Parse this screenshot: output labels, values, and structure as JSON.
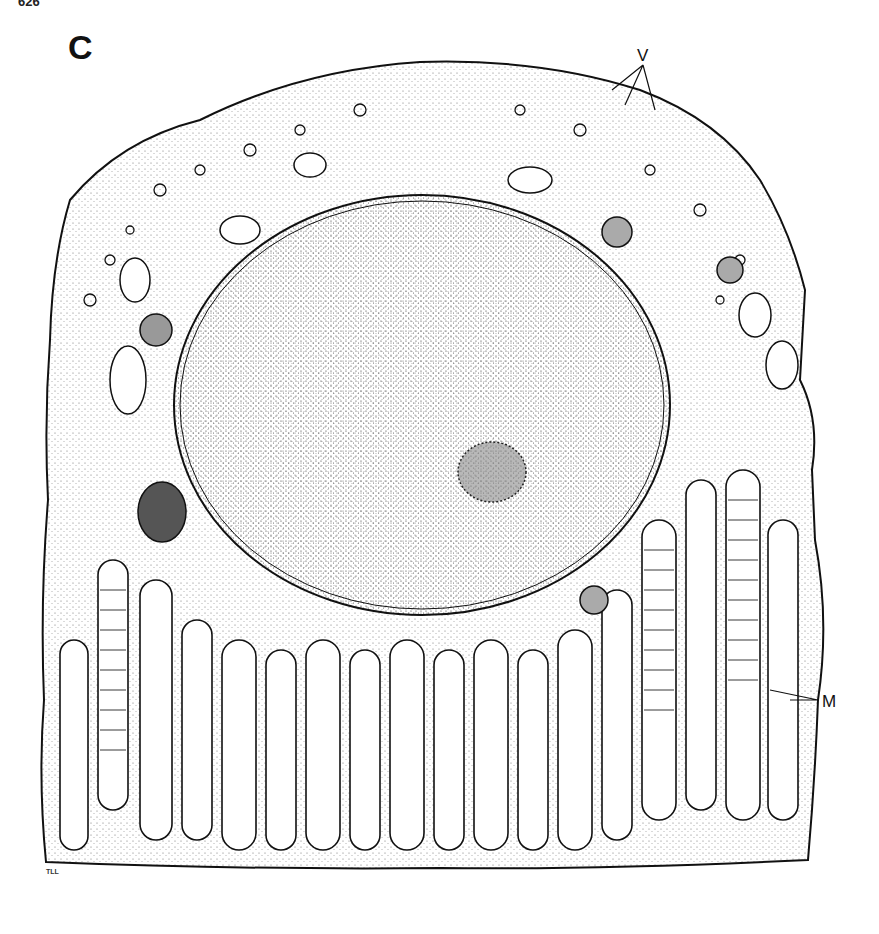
{
  "figure": {
    "page_number": "626",
    "panel_label": "C",
    "annotations": {
      "vesicles_label": "V",
      "mitochondria_label": "M"
    },
    "artist_initials": "TLL",
    "colors": {
      "ink": "#111111",
      "stipple": "#555555",
      "background": "#ffffff"
    }
  }
}
